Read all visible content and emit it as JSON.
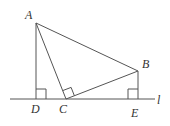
{
  "diagram": {
    "type": "geometry",
    "labels": {
      "A": "A",
      "B": "B",
      "C": "C",
      "D": "D",
      "E": "E",
      "l": "l"
    },
    "points": {
      "A": [
        36,
        23
      ],
      "B": [
        138,
        71
      ],
      "C": [
        66,
        99
      ],
      "D": [
        36,
        99
      ],
      "E": [
        138,
        99
      ]
    },
    "segments": [
      "AD",
      "AC",
      "AB",
      "BC",
      "BE"
    ],
    "line_l": {
      "from": [
        10,
        99
      ],
      "to": [
        155,
        99
      ]
    },
    "right_angles": [
      "ADC",
      "ACB",
      "BEC"
    ],
    "stroke_color": "#555555",
    "text_color": "#333333"
  }
}
